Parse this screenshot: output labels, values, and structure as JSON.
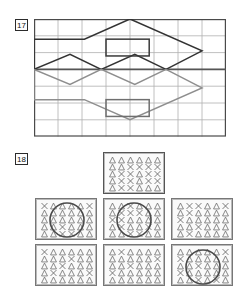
{
  "page": {
    "background": "#ffffff",
    "width": 240,
    "height": 292
  },
  "exercises": [
    {
      "number": "17",
      "type": "grid-symmetry-figure",
      "grid": {
        "cols": 8,
        "rows": 7,
        "cell_w": 24,
        "cell_h": 16.8,
        "line_color": "#b0b0b0",
        "border_color": "#4a4a4a"
      },
      "axis": {
        "label": "mirror-line",
        "orientation": "horizontal",
        "row": 3,
        "color": "#555555"
      },
      "shapes": [
        {
          "name": "house-outline-upper",
          "color": "#333333",
          "points": "0,3 0,1.2 2.1,1.2 4,0 7,1.9 5.5,3"
        },
        {
          "name": "zigzag-upper",
          "color": "#333333",
          "points": "0,3 1.5,2.1 2.8,3 4.2,2.1 5.5,3"
        },
        {
          "name": "window-rect-upper",
          "color": "#3a3a3a",
          "x": 3.0,
          "y": 1.2,
          "w": 1.8,
          "h": 1.0
        },
        {
          "name": "house-outline-lower-reflection",
          "color": "#8e8e8e",
          "points": "0,3 0,4.8 2.1,4.8 4,6 7,4.1 5.5,3"
        },
        {
          "name": "zigzag-lower-reflection",
          "color": "#8e8e8e",
          "points": "0,3 1.5,3.9 2.8,3 4.2,3.9 5.5,3"
        },
        {
          "name": "window-rect-lower-reflection",
          "color": "#6f6f6f",
          "x": 3.0,
          "y": 4.8,
          "w": 1.8,
          "h": 1.0
        }
      ]
    },
    {
      "number": "18",
      "type": "pattern-panels",
      "symbols": {
        "triangle": "triangle-glyph",
        "cross": "x-glyph"
      },
      "panel_layout": {
        "cols": 6,
        "rows": 5,
        "symbol_color": "#6c6c6c",
        "circle_color": "#4a4a4a",
        "border_color": "#777777"
      },
      "panels": [
        {
          "name": "reference-panel",
          "position": "top-center",
          "x": 103,
          "y": 4,
          "w": 62,
          "h": 42,
          "highlight": true,
          "has_circle": false,
          "cells": [
            [
              "T",
              "T",
              "T",
              "T",
              "T",
              "T"
            ],
            [
              "T",
              "T",
              "X",
              "X",
              "X",
              "X"
            ],
            [
              "T",
              "X",
              "X",
              "T",
              "X",
              "X"
            ],
            [
              "T",
              "X",
              "X",
              "T",
              "X",
              "X"
            ],
            [
              "T",
              "X",
              "X",
              "T",
              "T",
              "T"
            ]
          ]
        },
        {
          "name": "option-panel-1",
          "position": "middle-left",
          "x": 35,
          "y": 50,
          "w": 62,
          "h": 42,
          "highlight": false,
          "has_circle": true,
          "circle": {
            "cx": 31,
            "cy": 21,
            "r": 17
          },
          "cells": [
            [
              "X",
              "T",
              "T",
              "T",
              "T",
              "X"
            ],
            [
              "T",
              "T",
              "T",
              "T",
              "T",
              "T"
            ],
            [
              "T",
              "T",
              "T",
              "T",
              "T",
              "T"
            ],
            [
              "T",
              "T",
              "X",
              "T",
              "T",
              "T"
            ],
            [
              "T",
              "T",
              "X",
              "X",
              "T",
              "T"
            ]
          ]
        },
        {
          "name": "option-panel-2",
          "position": "middle-center",
          "x": 103,
          "y": 50,
          "w": 62,
          "h": 42,
          "highlight": false,
          "has_circle": true,
          "circle": {
            "cx": 30,
            "cy": 21,
            "r": 17
          },
          "cells": [
            [
              "T",
              "T",
              "X",
              "T",
              "T",
              "T"
            ],
            [
              "T",
              "X",
              "X",
              "X",
              "T",
              "T"
            ],
            [
              "X",
              "X",
              "T",
              "T",
              "T",
              "T"
            ],
            [
              "T",
              "X",
              "T",
              "T",
              "X",
              "T"
            ],
            [
              "T",
              "T",
              "X",
              "X",
              "T",
              "T"
            ]
          ]
        },
        {
          "name": "option-panel-3",
          "position": "middle-right",
          "x": 171,
          "y": 50,
          "w": 62,
          "h": 42,
          "highlight": false,
          "has_circle": false,
          "cells": [
            [
              "T",
              "X",
              "X",
              "T",
              "T",
              "X"
            ],
            [
              "T",
              "X",
              "T",
              "T",
              "T",
              "T"
            ],
            [
              "X",
              "T",
              "T",
              "T",
              "T",
              "T"
            ],
            [
              "T",
              "T",
              "X",
              "T",
              "T",
              "T"
            ],
            [
              "T",
              "X",
              "T",
              "T",
              "T",
              "T"
            ]
          ]
        },
        {
          "name": "option-panel-4",
          "position": "bottom-left",
          "x": 35,
          "y": 96,
          "w": 62,
          "h": 42,
          "highlight": false,
          "has_circle": false,
          "cells": [
            [
              "X",
              "T",
              "T",
              "T",
              "T",
              "T"
            ],
            [
              "T",
              "T",
              "T",
              "X",
              "T",
              "T"
            ],
            [
              "T",
              "T",
              "X",
              "T",
              "T",
              "T"
            ],
            [
              "T",
              "X",
              "T",
              "T",
              "T",
              "X"
            ],
            [
              "T",
              "T",
              "T",
              "T",
              "T",
              "T"
            ]
          ]
        },
        {
          "name": "option-panel-5",
          "position": "bottom-center",
          "x": 103,
          "y": 96,
          "w": 62,
          "h": 42,
          "highlight": false,
          "has_circle": false,
          "cells": [
            [
              "T",
              "X",
              "T",
              "T",
              "T",
              "T"
            ],
            [
              "T",
              "T",
              "T",
              "T",
              "T",
              "X"
            ],
            [
              "T",
              "T",
              "X",
              "T",
              "T",
              "T"
            ],
            [
              "X",
              "T",
              "T",
              "T",
              "T",
              "T"
            ],
            [
              "T",
              "T",
              "T",
              "T",
              "T",
              "T"
            ]
          ]
        },
        {
          "name": "option-panel-6",
          "position": "bottom-right",
          "x": 171,
          "y": 96,
          "w": 62,
          "h": 42,
          "highlight": false,
          "has_circle": true,
          "circle": {
            "cx": 31,
            "cy": 22,
            "r": 17
          },
          "cells": [
            [
              "T",
              "T",
              "T",
              "T",
              "T",
              "X"
            ],
            [
              "X",
              "T",
              "T",
              "T",
              "T",
              "T"
            ],
            [
              "T",
              "T",
              "X",
              "T",
              "T",
              "T"
            ],
            [
              "X",
              "T",
              "T",
              "T",
              "T",
              "T"
            ],
            [
              "T",
              "T",
              "X",
              "T",
              "X",
              "T"
            ]
          ]
        }
      ]
    }
  ]
}
